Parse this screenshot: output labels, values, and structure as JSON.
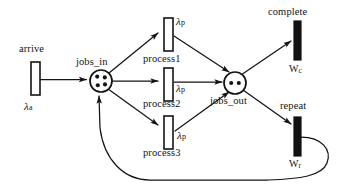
{
  "diagram": {
    "type": "petri-net",
    "stroke_color": "#141414",
    "fill_color": "#ffffff",
    "filled_transition_color": "#111111",
    "background": "#ffffff"
  },
  "places": [
    {
      "id": "jobs_in",
      "label": "jobs_in",
      "tokens": 4,
      "cx": 101,
      "cy": 81,
      "r": 11
    },
    {
      "id": "jobs_out",
      "label": "jobs_out",
      "tokens": 2,
      "cx": 235,
      "cy": 83,
      "r": 11
    }
  ],
  "transitions": [
    {
      "id": "arrive",
      "label": "arrive",
      "rate_symbol": "λ",
      "rate_sub": "a",
      "filled": false,
      "x": 31,
      "y": 62,
      "w": 9,
      "h": 33
    },
    {
      "id": "process1",
      "label": "process1",
      "rate_symbol": "λ",
      "rate_sub": "p",
      "filled": false,
      "x": 164,
      "y": 18,
      "w": 9,
      "h": 33
    },
    {
      "id": "process2",
      "label": "process2",
      "rate_symbol": "λ",
      "rate_sub": "p",
      "filled": false,
      "x": 164,
      "y": 68,
      "w": 9,
      "h": 33
    },
    {
      "id": "process3",
      "label": "process3",
      "rate_symbol": "λ",
      "rate_sub": "p",
      "filled": false,
      "x": 164,
      "y": 116,
      "w": 9,
      "h": 33
    },
    {
      "id": "complete",
      "label": "complete",
      "rate_symbol": "W",
      "rate_sub": "c",
      "filled": true,
      "x": 294,
      "y": 21,
      "w": 7,
      "h": 39
    },
    {
      "id": "repeat",
      "label": "repeat",
      "rate_symbol": "W",
      "rate_sub": "r",
      "filled": true,
      "x": 294,
      "y": 117,
      "w": 7,
      "h": 39
    }
  ],
  "labels": {
    "arrive": "arrive",
    "jobs_in": "jobs_in",
    "jobs_out": "jobs_out",
    "process1": "process1",
    "process2": "process2",
    "process3": "process3",
    "complete": "complete",
    "repeat": "repeat",
    "lambda": "λ",
    "sub_a": "a",
    "sub_p": "p",
    "w": "W",
    "sub_c": "c",
    "sub_r": "r"
  },
  "arcs": [
    {
      "id": "arrive-to-jobs_in",
      "from": "arrive",
      "to": "jobs_in",
      "shape": "straight"
    },
    {
      "id": "jobs_in-to-process1",
      "from": "jobs_in",
      "to": "process1",
      "shape": "straight"
    },
    {
      "id": "jobs_in-to-process2",
      "from": "jobs_in",
      "to": "process2",
      "shape": "straight"
    },
    {
      "id": "jobs_in-to-process3",
      "from": "jobs_in",
      "to": "process3",
      "shape": "straight"
    },
    {
      "id": "process1-to-jobs_out",
      "from": "process1",
      "to": "jobs_out",
      "shape": "straight"
    },
    {
      "id": "process2-to-jobs_out",
      "from": "process2",
      "to": "jobs_out",
      "shape": "straight"
    },
    {
      "id": "process3-to-jobs_out",
      "from": "process3",
      "to": "jobs_out",
      "shape": "straight"
    },
    {
      "id": "jobs_out-to-complete",
      "from": "jobs_out",
      "to": "complete",
      "shape": "straight"
    },
    {
      "id": "jobs_out-to-repeat",
      "from": "jobs_out",
      "to": "repeat",
      "shape": "straight"
    },
    {
      "id": "repeat-to-jobs_in",
      "from": "repeat",
      "to": "jobs_in",
      "shape": "curved-feedback"
    }
  ]
}
